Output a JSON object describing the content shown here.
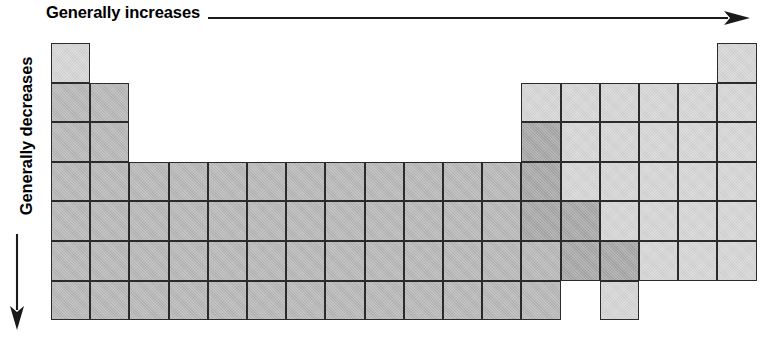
{
  "figure": {
    "kind": "periodic-table-trend-diagram",
    "background_color": "#ffffff",
    "border_color": "#2b2b2b"
  },
  "axes": {
    "top": {
      "label": "Generally increases",
      "icon": "arrow-right-icon",
      "direction": "right"
    },
    "left": {
      "label": "Generally decreases",
      "icon": "arrow-down-icon",
      "direction": "down"
    }
  },
  "legend_shades": {
    "light": "#d5d5d5",
    "medium": "#b6b6b6",
    "dark": "#a6a6a6"
  },
  "chart_data": {
    "type": "heatmap",
    "title": "",
    "subtitle": "",
    "xlabel": "Generally increases",
    "ylabel": "Generally decreases",
    "xlim": [
      1,
      18
    ],
    "ylim": [
      1,
      7
    ],
    "grid": true,
    "legend_position": "none",
    "columns": 18,
    "rows": 7,
    "cell_width": 39.2,
    "cell_height": 39.6,
    "col_tick_labels": [
      "1",
      "2",
      "3",
      "4",
      "5",
      "6",
      "7",
      "8",
      "9",
      "10",
      "11",
      "12",
      "13",
      "14",
      "15",
      "16",
      "17",
      "18"
    ],
    "row_tick_labels": [
      "1",
      "2",
      "3",
      "4",
      "5",
      "6",
      "7"
    ],
    "annotations": [],
    "cells": [
      {
        "row": 1,
        "col": 1,
        "shade": "light"
      },
      {
        "row": 1,
        "col": 18,
        "shade": "light"
      },
      {
        "row": 2,
        "col": 1,
        "shade": "medium"
      },
      {
        "row": 2,
        "col": 2,
        "shade": "medium"
      },
      {
        "row": 2,
        "col": 13,
        "shade": "light"
      },
      {
        "row": 2,
        "col": 14,
        "shade": "light"
      },
      {
        "row": 2,
        "col": 15,
        "shade": "light"
      },
      {
        "row": 2,
        "col": 16,
        "shade": "light"
      },
      {
        "row": 2,
        "col": 17,
        "shade": "light"
      },
      {
        "row": 2,
        "col": 18,
        "shade": "light"
      },
      {
        "row": 3,
        "col": 1,
        "shade": "medium"
      },
      {
        "row": 3,
        "col": 2,
        "shade": "medium"
      },
      {
        "row": 3,
        "col": 13,
        "shade": "dark"
      },
      {
        "row": 3,
        "col": 14,
        "shade": "light"
      },
      {
        "row": 3,
        "col": 15,
        "shade": "light"
      },
      {
        "row": 3,
        "col": 16,
        "shade": "light"
      },
      {
        "row": 3,
        "col": 17,
        "shade": "light"
      },
      {
        "row": 3,
        "col": 18,
        "shade": "light"
      },
      {
        "row": 4,
        "col": 1,
        "shade": "medium"
      },
      {
        "row": 4,
        "col": 2,
        "shade": "medium"
      },
      {
        "row": 4,
        "col": 3,
        "shade": "medium"
      },
      {
        "row": 4,
        "col": 4,
        "shade": "medium"
      },
      {
        "row": 4,
        "col": 5,
        "shade": "medium"
      },
      {
        "row": 4,
        "col": 6,
        "shade": "medium"
      },
      {
        "row": 4,
        "col": 7,
        "shade": "medium"
      },
      {
        "row": 4,
        "col": 8,
        "shade": "medium"
      },
      {
        "row": 4,
        "col": 9,
        "shade": "medium"
      },
      {
        "row": 4,
        "col": 10,
        "shade": "medium"
      },
      {
        "row": 4,
        "col": 11,
        "shade": "medium"
      },
      {
        "row": 4,
        "col": 12,
        "shade": "medium"
      },
      {
        "row": 4,
        "col": 13,
        "shade": "dark"
      },
      {
        "row": 4,
        "col": 14,
        "shade": "light"
      },
      {
        "row": 4,
        "col": 15,
        "shade": "light"
      },
      {
        "row": 4,
        "col": 16,
        "shade": "light"
      },
      {
        "row": 4,
        "col": 17,
        "shade": "light"
      },
      {
        "row": 4,
        "col": 18,
        "shade": "light"
      },
      {
        "row": 5,
        "col": 1,
        "shade": "medium"
      },
      {
        "row": 5,
        "col": 2,
        "shade": "medium"
      },
      {
        "row": 5,
        "col": 3,
        "shade": "medium"
      },
      {
        "row": 5,
        "col": 4,
        "shade": "medium"
      },
      {
        "row": 5,
        "col": 5,
        "shade": "medium"
      },
      {
        "row": 5,
        "col": 6,
        "shade": "medium"
      },
      {
        "row": 5,
        "col": 7,
        "shade": "medium"
      },
      {
        "row": 5,
        "col": 8,
        "shade": "medium"
      },
      {
        "row": 5,
        "col": 9,
        "shade": "medium"
      },
      {
        "row": 5,
        "col": 10,
        "shade": "medium"
      },
      {
        "row": 5,
        "col": 11,
        "shade": "medium"
      },
      {
        "row": 5,
        "col": 12,
        "shade": "medium"
      },
      {
        "row": 5,
        "col": 13,
        "shade": "dark"
      },
      {
        "row": 5,
        "col": 14,
        "shade": "dark"
      },
      {
        "row": 5,
        "col": 15,
        "shade": "light"
      },
      {
        "row": 5,
        "col": 16,
        "shade": "light"
      },
      {
        "row": 5,
        "col": 17,
        "shade": "light"
      },
      {
        "row": 5,
        "col": 18,
        "shade": "light"
      },
      {
        "row": 6,
        "col": 1,
        "shade": "medium"
      },
      {
        "row": 6,
        "col": 2,
        "shade": "medium"
      },
      {
        "row": 6,
        "col": 3,
        "shade": "medium"
      },
      {
        "row": 6,
        "col": 4,
        "shade": "medium"
      },
      {
        "row": 6,
        "col": 5,
        "shade": "medium"
      },
      {
        "row": 6,
        "col": 6,
        "shade": "medium"
      },
      {
        "row": 6,
        "col": 7,
        "shade": "medium"
      },
      {
        "row": 6,
        "col": 8,
        "shade": "medium"
      },
      {
        "row": 6,
        "col": 9,
        "shade": "medium"
      },
      {
        "row": 6,
        "col": 10,
        "shade": "medium"
      },
      {
        "row": 6,
        "col": 11,
        "shade": "medium"
      },
      {
        "row": 6,
        "col": 12,
        "shade": "medium"
      },
      {
        "row": 6,
        "col": 13,
        "shade": "medium"
      },
      {
        "row": 6,
        "col": 14,
        "shade": "dark"
      },
      {
        "row": 6,
        "col": 15,
        "shade": "dark"
      },
      {
        "row": 6,
        "col": 16,
        "shade": "light"
      },
      {
        "row": 6,
        "col": 17,
        "shade": "light"
      },
      {
        "row": 6,
        "col": 18,
        "shade": "light"
      },
      {
        "row": 7,
        "col": 1,
        "shade": "medium"
      },
      {
        "row": 7,
        "col": 2,
        "shade": "medium"
      },
      {
        "row": 7,
        "col": 3,
        "shade": "medium"
      },
      {
        "row": 7,
        "col": 4,
        "shade": "medium"
      },
      {
        "row": 7,
        "col": 5,
        "shade": "medium"
      },
      {
        "row": 7,
        "col": 6,
        "shade": "medium"
      },
      {
        "row": 7,
        "col": 7,
        "shade": "medium"
      },
      {
        "row": 7,
        "col": 8,
        "shade": "medium"
      },
      {
        "row": 7,
        "col": 9,
        "shade": "medium"
      },
      {
        "row": 7,
        "col": 10,
        "shade": "medium"
      },
      {
        "row": 7,
        "col": 11,
        "shade": "medium"
      },
      {
        "row": 7,
        "col": 12,
        "shade": "medium"
      },
      {
        "row": 7,
        "col": 13,
        "shade": "medium"
      },
      {
        "row": 7,
        "col": 15,
        "shade": "light"
      }
    ]
  }
}
